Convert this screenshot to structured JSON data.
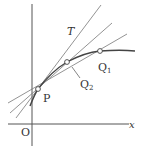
{
  "diagram": {
    "labels": {
      "tangent": "T",
      "point_p": "P",
      "point_q1": "Q",
      "point_q1_sub": "1",
      "point_q2": "Q",
      "point_q2_sub": "2",
      "origin": "O",
      "x_axis": "x"
    },
    "colors": {
      "line": "#555555",
      "curve": "#444444",
      "point_fill": "#ffffff"
    }
  }
}
